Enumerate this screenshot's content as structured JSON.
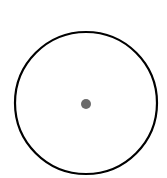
{
  "diagram": {
    "width": 167,
    "height": 178,
    "background": "#ffffff",
    "circle": {
      "cx": 86,
      "cy": 103,
      "r": 71,
      "stroke": "#000000",
      "stroke_width": 2.2,
      "fill": "none"
    },
    "center_dot": {
      "cx": 86,
      "cy": 104,
      "r": 5,
      "fill": "#6b6b6b"
    }
  }
}
